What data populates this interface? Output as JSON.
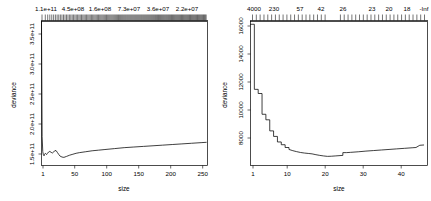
{
  "figure": {
    "background_color": "#ffffff",
    "line_color": "#000000",
    "panel_count": 2
  },
  "chart_data": [
    {
      "type": "line",
      "panel": "left",
      "title": "",
      "xlabel": "size",
      "ylabel": "deviance",
      "xlim": [
        1,
        260
      ],
      "ylim": [
        130000000000,
        360000000000
      ],
      "grid": false,
      "legend": null,
      "xticks": [
        1,
        50,
        100,
        150,
        200,
        250
      ],
      "xticklabels": [
        "1",
        "50",
        "100",
        "150",
        "200",
        "250"
      ],
      "yticks": [
        150000000000,
        200000000000,
        250000000000,
        300000000000,
        350000000000
      ],
      "yticklabels": [
        "1.5e+11",
        "2.0e+11",
        "2.5e+11",
        "3.0e+11",
        "3.5e+11"
      ],
      "top_axis": {
        "label": "",
        "ticks": [
          1,
          22,
          57,
          100,
          150,
          205
        ],
        "ticklabels": [
          "1.1e+11",
          "4.5e+08",
          "1.6e+08",
          "7.3e+07",
          "3.6e+07",
          "2.2e+07"
        ],
        "rug": "dense"
      },
      "x": [
        1,
        2,
        3,
        4,
        5,
        6,
        7,
        8,
        9,
        10,
        12,
        14,
        16,
        18,
        20,
        22,
        24,
        26,
        28,
        30,
        33,
        36,
        40,
        45,
        50,
        55,
        60,
        70,
        80,
        90,
        100,
        115,
        130,
        145,
        160,
        175,
        190,
        205,
        220,
        235,
        250,
        258
      ],
      "y": [
        360000000000,
        176000000000,
        152000000000,
        147000000000,
        145500000000,
        148000000000,
        149500000000,
        148500000000,
        147500000000,
        149000000000,
        151500000000,
        152500000000,
        151000000000,
        150000000000,
        151500000000,
        154000000000,
        153500000000,
        150500000000,
        147500000000,
        145000000000,
        143500000000,
        143000000000,
        144500000000,
        146500000000,
        148000000000,
        149500000000,
        150500000000,
        152000000000,
        153500000000,
        154500000000,
        155500000000,
        157000000000,
        158500000000,
        159500000000,
        160500000000,
        161500000000,
        162500000000,
        163500000000,
        164500000000,
        165500000000,
        166500000000,
        167000000000
      ]
    },
    {
      "type": "line",
      "panel": "right",
      "title": "",
      "xlabel": "size",
      "ylabel": "deviance",
      "xlim": [
        1,
        47
      ],
      "ylim": [
        6400,
        16800
      ],
      "grid": false,
      "legend": null,
      "xticks": [
        1,
        10,
        20,
        30,
        40
      ],
      "xticklabels": [
        "1",
        "10",
        "20",
        "30",
        "40"
      ],
      "yticks": [
        8000,
        10000,
        12000,
        14000,
        16000
      ],
      "yticklabels": [
        "8000",
        "10000",
        "12000",
        "14000",
        "16000"
      ],
      "top_axis": {
        "label": "",
        "ticks": [
          1,
          4,
          10,
          15,
          21,
          29,
          34,
          40,
          46
        ],
        "ticklabels": [
          "4000",
          "230",
          "57",
          "42",
          "26",
          "23",
          "20",
          "18",
          "-Inf"
        ],
        "rug": "discrete"
      },
      "x": [
        1,
        2,
        2,
        3,
        3,
        4,
        4,
        5,
        5,
        6,
        6,
        7,
        7,
        8,
        8,
        9,
        9,
        10,
        10,
        11,
        11,
        12,
        13,
        14,
        15,
        16,
        17,
        18,
        19,
        20,
        21,
        22,
        23,
        24,
        25,
        25,
        26,
        27,
        29,
        31,
        33,
        35,
        37,
        39,
        41,
        43,
        44,
        45,
        46
      ],
      "y": [
        16600,
        16600,
        11900,
        11900,
        11600,
        11600,
        10100,
        10100,
        9700,
        9700,
        8900,
        8900,
        8500,
        8500,
        8100,
        8100,
        7900,
        7900,
        7700,
        7700,
        7560,
        7470,
        7400,
        7340,
        7300,
        7270,
        7240,
        7180,
        7130,
        7090,
        7060,
        7070,
        7090,
        7110,
        7130,
        7330,
        7330,
        7350,
        7390,
        7440,
        7480,
        7520,
        7560,
        7600,
        7640,
        7680,
        7700,
        7860,
        7880
      ]
    }
  ]
}
